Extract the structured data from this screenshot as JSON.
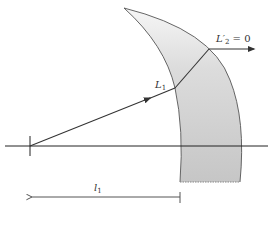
{
  "diagram": {
    "labels": {
      "ray_in": {
        "main": "L",
        "sub": "1"
      },
      "ray_out": {
        "main": "L′",
        "sub": "2",
        "suffix": " = 0"
      },
      "distance": {
        "main": "l",
        "sub": "1"
      }
    },
    "colors": {
      "line": "#333333",
      "layer_fill_top": "#f4f4f4",
      "layer_fill_bottom": "#c8c8c8",
      "layer_edge": "#555555",
      "axis": "#222222"
    },
    "elements": [
      "optical-axis",
      "source-tick",
      "incident-ray-L1",
      "refracted-ray-in-layer",
      "exit-ray-L2",
      "curved-layer",
      "distance-arrow-l1"
    ]
  }
}
